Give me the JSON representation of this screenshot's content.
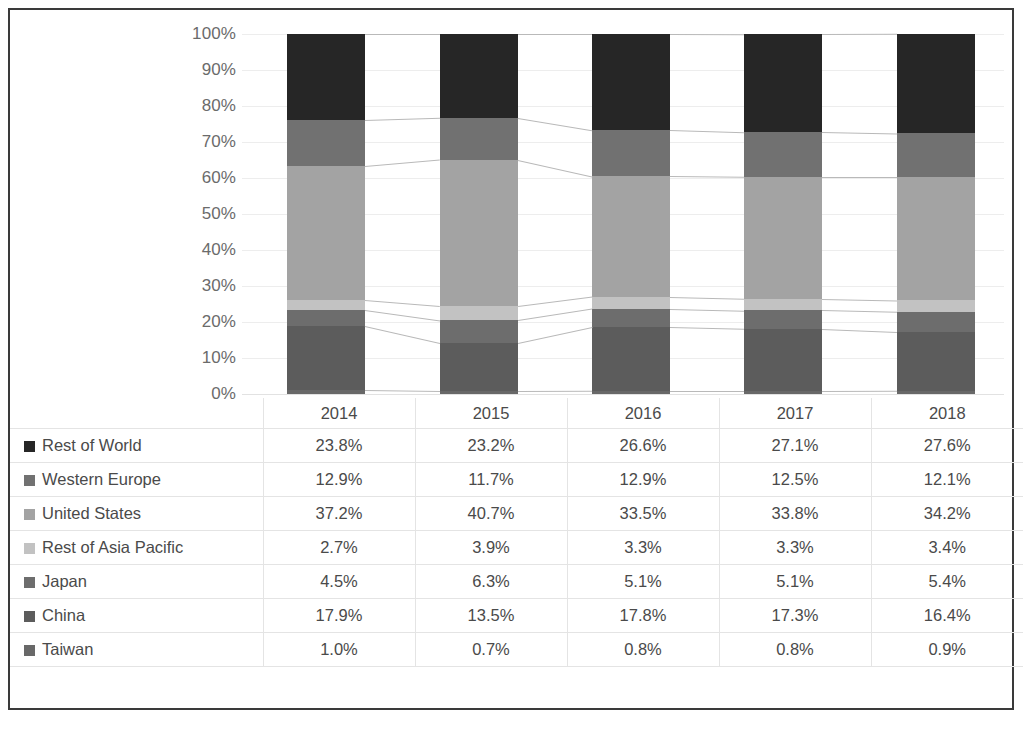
{
  "chart_data": {
    "type": "bar",
    "stacked": true,
    "percent_stacked": true,
    "title": "",
    "xlabel": "",
    "ylabel": "",
    "ylim": [
      0,
      100
    ],
    "grid": true,
    "legend_position": "table-left",
    "categories": [
      "2014",
      "2015",
      "2016",
      "2017",
      "2018"
    ],
    "ytick_labels": [
      "100%",
      "90%",
      "80%",
      "70%",
      "60%",
      "50%",
      "40%",
      "30%",
      "20%",
      "10%",
      "0%"
    ],
    "ytick_values": [
      100,
      90,
      80,
      70,
      60,
      50,
      40,
      30,
      20,
      10,
      0
    ],
    "stack_order_bottom_to_top": [
      "Taiwan",
      "China",
      "Japan",
      "Rest of Asia Pacific",
      "United States",
      "Western Europe",
      "Rest of World"
    ],
    "series": [
      {
        "name": "Rest of World",
        "color": "#262626",
        "values": [
          23.8,
          23.2,
          26.6,
          27.1,
          27.6
        ],
        "labels": [
          "23.8%",
          "23.2%",
          "26.6%",
          "27.1%",
          "27.6%"
        ]
      },
      {
        "name": "Western Europe",
        "color": "#717171",
        "values": [
          12.9,
          11.7,
          12.9,
          12.5,
          12.1
        ],
        "labels": [
          "12.9%",
          "11.7%",
          "12.9%",
          "12.5%",
          "12.1%"
        ]
      },
      {
        "name": "United States",
        "color": "#a3a3a3",
        "values": [
          37.2,
          40.7,
          33.5,
          33.8,
          34.2
        ],
        "labels": [
          "37.2%",
          "40.7%",
          "33.5%",
          "33.8%",
          "34.2%"
        ]
      },
      {
        "name": "Rest of Asia Pacific",
        "color": "#c2c2c2",
        "values": [
          2.7,
          3.9,
          3.3,
          3.3,
          3.4
        ],
        "labels": [
          "2.7%",
          "3.9%",
          "3.3%",
          "3.3%",
          "3.4%"
        ]
      },
      {
        "name": "Japan",
        "color": "#6d6d6d",
        "values": [
          4.5,
          6.3,
          5.1,
          5.1,
          5.4
        ],
        "labels": [
          "4.5%",
          "6.3%",
          "5.1%",
          "5.1%",
          "5.4%"
        ]
      },
      {
        "name": "China",
        "color": "#5c5c5c",
        "values": [
          17.9,
          13.5,
          17.8,
          17.3,
          16.4
        ],
        "labels": [
          "17.9%",
          "13.5%",
          "17.8%",
          "17.3%",
          "16.4%"
        ]
      },
      {
        "name": "Taiwan",
        "color": "#686868",
        "values": [
          1.0,
          0.7,
          0.8,
          0.8,
          0.9
        ],
        "labels": [
          "1.0%",
          "0.7%",
          "0.8%",
          "0.8%",
          "0.9%"
        ]
      }
    ]
  },
  "table": {
    "corner_label": "",
    "column_headers": [
      "2014",
      "2015",
      "2016",
      "2017",
      "2018"
    ],
    "rows": [
      {
        "label": "Rest of World",
        "swatch": "#262626",
        "values": [
          "23.8%",
          "23.2%",
          "26.6%",
          "27.1%",
          "27.6%"
        ]
      },
      {
        "label": "Western Europe",
        "swatch": "#717171",
        "values": [
          "12.9%",
          "11.7%",
          "12.9%",
          "12.5%",
          "12.1%"
        ]
      },
      {
        "label": "United States",
        "swatch": "#a3a3a3",
        "values": [
          "37.2%",
          "40.7%",
          "33.5%",
          "33.8%",
          "34.2%"
        ]
      },
      {
        "label": "Rest of Asia Pacific",
        "swatch": "#c2c2c2",
        "values": [
          "2.7%",
          "3.9%",
          "3.3%",
          "3.3%",
          "3.4%"
        ]
      },
      {
        "label": "Japan",
        "swatch": "#6d6d6d",
        "values": [
          "4.5%",
          "6.3%",
          "5.1%",
          "5.1%",
          "5.4%"
        ]
      },
      {
        "label": "China",
        "swatch": "#5c5c5c",
        "values": [
          "17.9%",
          "13.5%",
          "17.8%",
          "17.3%",
          "16.4%"
        ]
      },
      {
        "label": "Taiwan",
        "swatch": "#686868",
        "values": [
          "1.0%",
          "0.7%",
          "0.8%",
          "0.8%",
          "0.9%"
        ]
      }
    ]
  },
  "style": {
    "border_color": "#3a3a3a",
    "gridline_color": "#ededed",
    "connector_color": "#b9b9b9",
    "text_color": "#4a4a4a",
    "axis_text_color": "#6b6b6b"
  }
}
